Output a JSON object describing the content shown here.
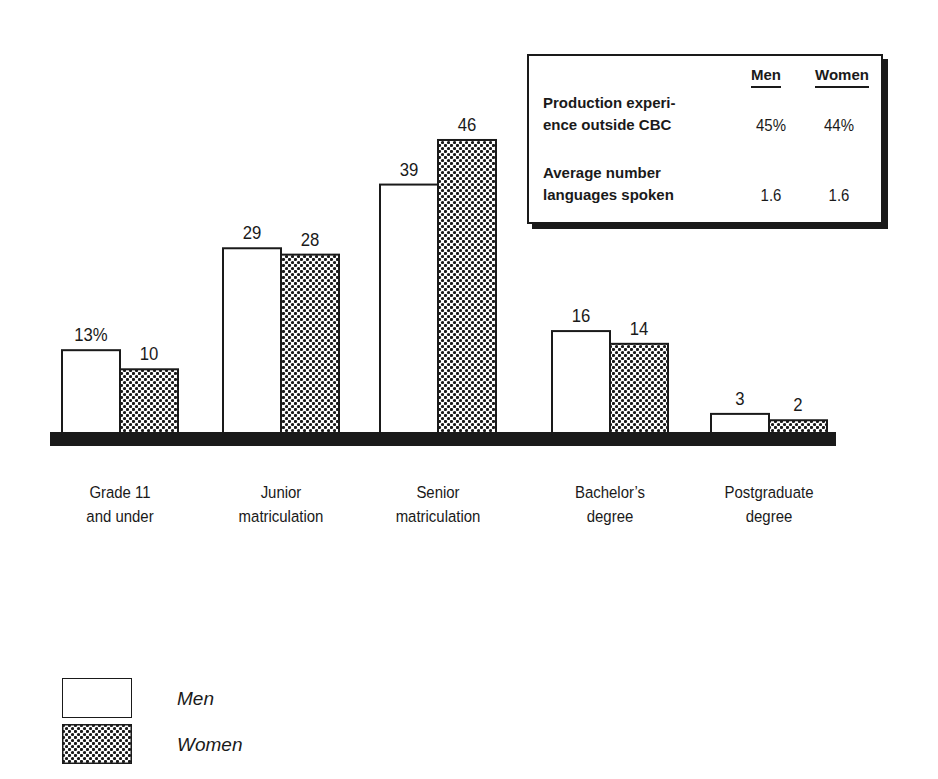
{
  "chart_data": {
    "type": "bar",
    "title": "",
    "xlabel": "",
    "ylabel": "",
    "ylim": [
      0,
      46
    ],
    "grid": false,
    "legend_position": "bottom-left",
    "categories": [
      [
        "Grade 11",
        "and under"
      ],
      [
        "Junior",
        "matriculation"
      ],
      [
        "Senior",
        "matriculation"
      ],
      [
        "Bachelor’s",
        "degree"
      ],
      [
        "Postgraduate",
        "degree"
      ]
    ],
    "series": [
      {
        "name": "Men",
        "pattern": "white",
        "values": [
          13,
          29,
          39,
          16,
          3
        ],
        "labels": [
          "13%",
          "29",
          "39",
          "16",
          "3"
        ]
      },
      {
        "name": "Women",
        "pattern": "dotted",
        "values": [
          10,
          28,
          46,
          14,
          2
        ],
        "labels": [
          "10",
          "28",
          "46",
          "14",
          "2"
        ]
      }
    ],
    "inset_table": {
      "columns": [
        "Men",
        "Women"
      ],
      "rows": [
        {
          "label": [
            "Production experi-",
            "ence outside CBC"
          ],
          "values": [
            "45%",
            "44%"
          ]
        },
        {
          "label": [
            "Average number",
            "languages spoken"
          ],
          "values": [
            "1.6",
            "1.6"
          ]
        }
      ]
    }
  },
  "legend": {
    "items": [
      {
        "label": "Men"
      },
      {
        "label": "Women"
      }
    ]
  },
  "colors": {
    "ink": "#1a1a1a",
    "background": "#ffffff"
  }
}
